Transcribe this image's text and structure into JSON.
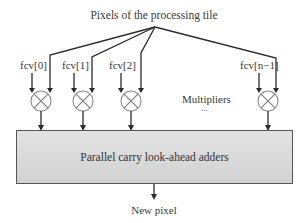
{
  "title": "Pixels of the processing tile",
  "coefficients": [
    {
      "label": "fcv[0]"
    },
    {
      "label": "fcv[1]"
    },
    {
      "label": "fcv[2]"
    },
    {
      "label": "fcv[n−1]"
    }
  ],
  "multipliers_label": "Multipliers",
  "ellipsis": "...",
  "adder_label": "Parallel carry look-ahead adders",
  "output_label": "New pixel",
  "colors": {
    "line": "#2a2a2a",
    "adder_fill": "#d8d8d8",
    "adder_stroke": "#555555"
  }
}
